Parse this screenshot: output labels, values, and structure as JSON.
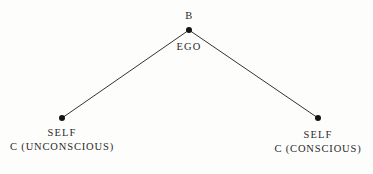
{
  "figure": {
    "background_color": "#fdfdfc",
    "line_color": "#333333",
    "dot_color": "#141414",
    "text_color": "#2a2a2a"
  },
  "nodes": [
    {
      "id": "apex",
      "name": "ego-node",
      "x": 189,
      "y": 30,
      "top_label": "B",
      "bottom_label": "EGO"
    },
    {
      "id": "left",
      "name": "unconscious-self-node",
      "x": 62,
      "y": 118,
      "line1": "SELF",
      "line2": "C (UNCONSCIOUS)"
    },
    {
      "id": "right",
      "name": "conscious-self-node",
      "x": 318,
      "y": 118,
      "line1": "SELF",
      "line2": "C (CONSCIOUS)"
    }
  ],
  "edges": [
    {
      "name": "ego-to-unconscious-self",
      "x1": 189,
      "y1": 30,
      "x2": 62,
      "y2": 118
    },
    {
      "name": "ego-to-conscious-self",
      "x1": 189,
      "y1": 30,
      "x2": 318,
      "y2": 118
    }
  ],
  "caption_remnant": {
    "left_fragment": "",
    "right_fragment": ""
  }
}
